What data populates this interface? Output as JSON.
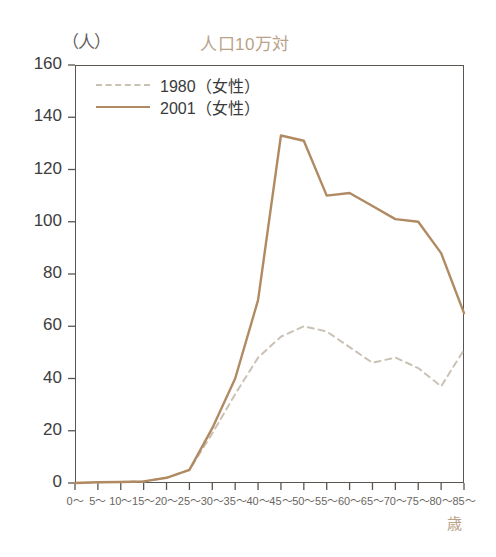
{
  "chart_data": {
    "type": "line",
    "title": "人口10万対",
    "ylabel": "（人）",
    "xlabel": "歳",
    "ylim": [
      0,
      160
    ],
    "yticks": [
      0,
      20,
      40,
      60,
      80,
      100,
      120,
      140,
      160
    ],
    "grid": false,
    "legend_position": "top-left",
    "categories": [
      "0～",
      "5～",
      "10～",
      "15～",
      "20～",
      "25～",
      "30～",
      "35～",
      "40～",
      "45～",
      "50～",
      "55～",
      "60～",
      "65～",
      "70～",
      "75～",
      "80～",
      "85～"
    ],
    "series": [
      {
        "name": "1980（女性）",
        "style": "dashed",
        "color": "#c9c2b4",
        "values": [
          0,
          0.3,
          0.4,
          0.6,
          2,
          5,
          19,
          34,
          48,
          56,
          60,
          58,
          52,
          46,
          48,
          44,
          37,
          51
        ]
      },
      {
        "name": "2001（女性）",
        "style": "solid",
        "color": "#b08a62",
        "values": [
          0,
          0.3,
          0.4,
          0.6,
          2,
          5,
          21,
          40,
          70,
          133,
          131,
          110,
          111,
          106,
          101,
          100,
          88,
          65
        ]
      }
    ]
  },
  "legend": {
    "items": [
      {
        "label": "1980（女性）",
        "style": "dashed"
      },
      {
        "label": "2001（女性）",
        "style": "solid"
      }
    ]
  },
  "colors": {
    "series_1980": "#c9c2b4",
    "series_2001": "#b08a62",
    "title": "#b9a288",
    "axis": "#5a5550",
    "tick_text": "#3d3d3d"
  }
}
